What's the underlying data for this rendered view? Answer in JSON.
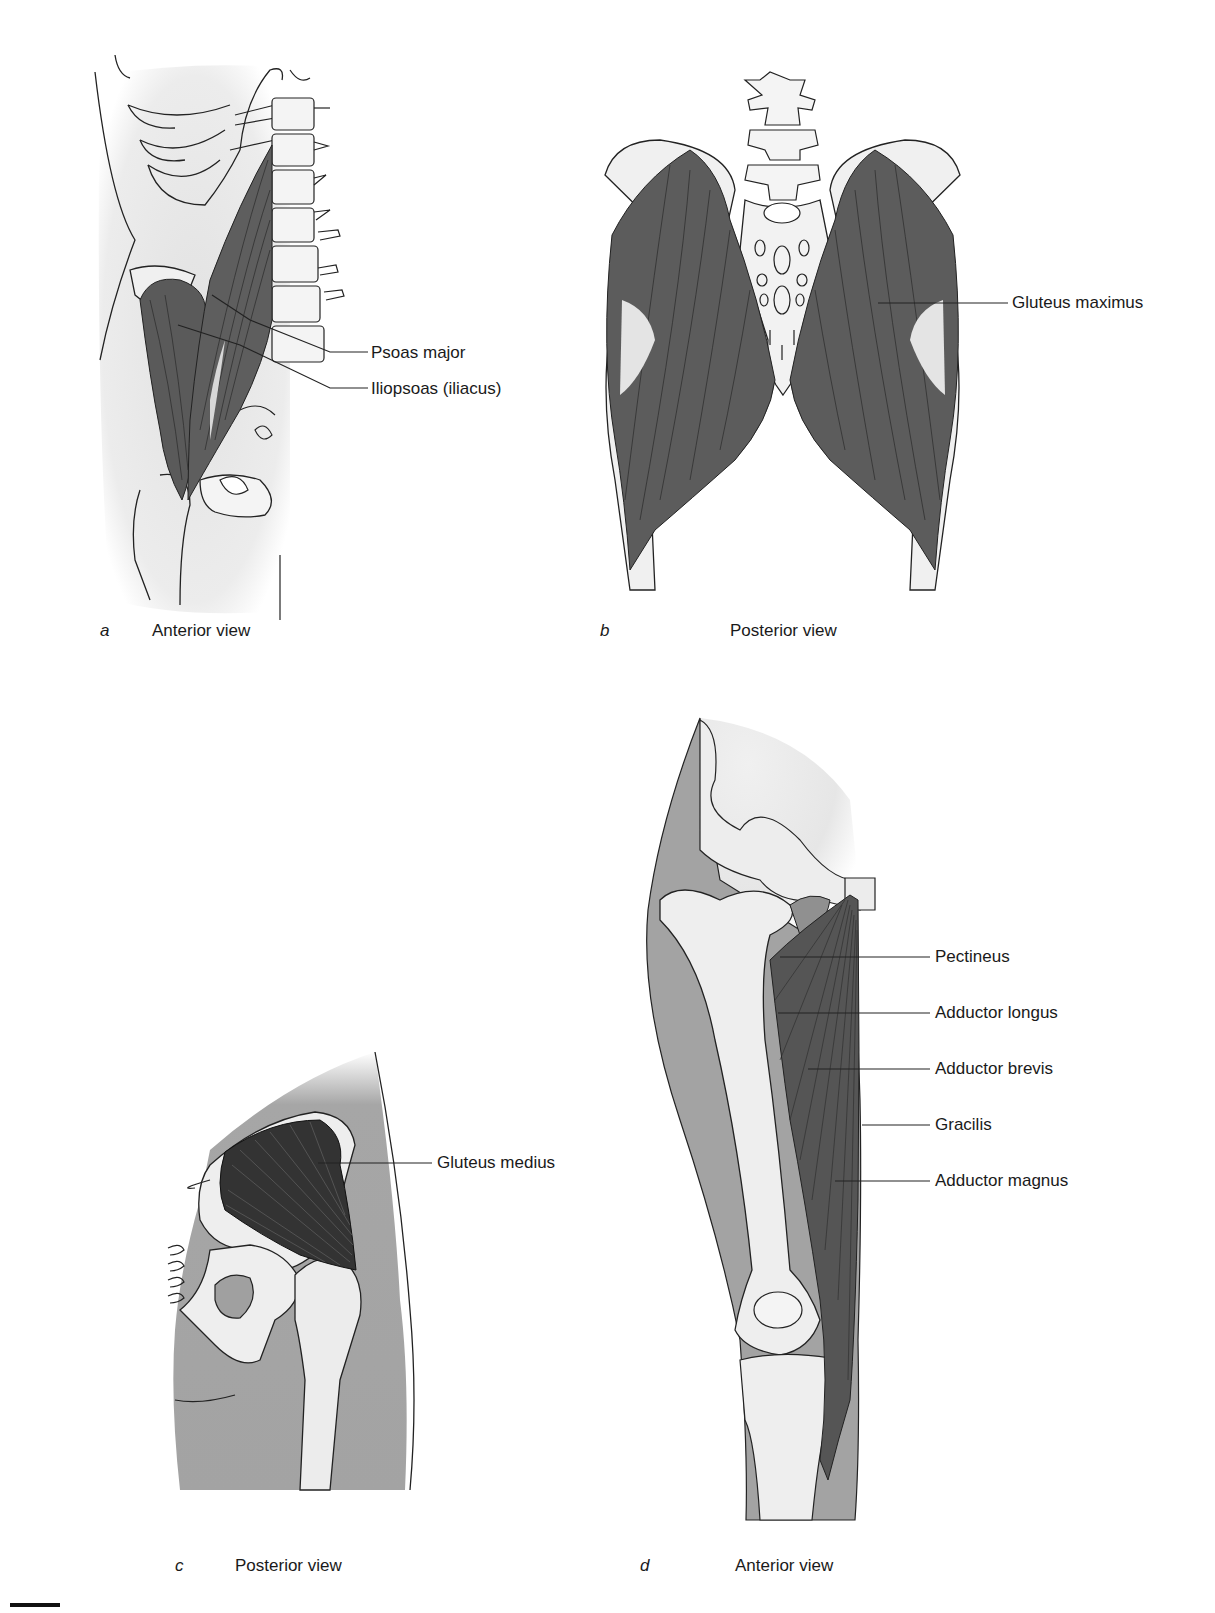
{
  "figure": {
    "panels": [
      {
        "id": "a",
        "letter": "a",
        "caption": "Anterior view",
        "labels": [
          "Psoas major",
          "Iliopsoas (iliacus)"
        ]
      },
      {
        "id": "b",
        "letter": "b",
        "caption": "Posterior view",
        "labels": [
          "Gluteus maximus"
        ]
      },
      {
        "id": "c",
        "letter": "c",
        "caption": "Posterior view",
        "labels": [
          "Gluteus medius"
        ]
      },
      {
        "id": "d",
        "letter": "d",
        "caption": "Anterior view",
        "labels": [
          "Pectineus",
          "Adductor longus",
          "Adductor brevis",
          "Gracilis",
          "Adductor magnus"
        ]
      }
    ],
    "colors": {
      "muscle": "#5e5e5e",
      "muscle_fiber": "#2b2b2b",
      "soft_tissue": "#a3a3a3",
      "light_tissue": "#e6e6e6",
      "bone": "#efefef",
      "outline": "#222222",
      "background": "#ffffff"
    }
  }
}
